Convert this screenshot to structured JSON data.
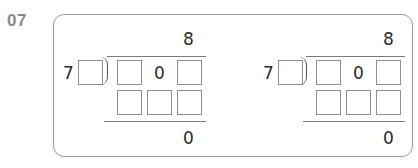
{
  "question": {
    "number": "07"
  },
  "problems": [
    {
      "quotient_ones": "8",
      "divisor_tens": "7",
      "dividend_tens": "0",
      "remainder": "0"
    },
    {
      "quotient_ones": "8",
      "divisor_tens": "7",
      "dividend_tens": "0",
      "remainder": "0"
    }
  ],
  "colors": {
    "label": "#8a8a8a",
    "border": "#9a9a9a",
    "text": "#2b2b2b"
  }
}
